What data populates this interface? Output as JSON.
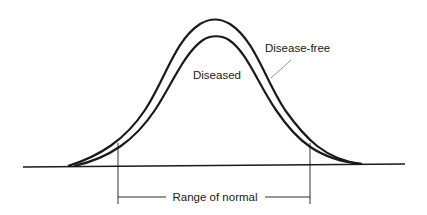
{
  "figure": {
    "type": "diagram",
    "curves": [
      {
        "name": "Disease-free",
        "label": "Disease-free"
      },
      {
        "name": "Diseased",
        "label": "Diseased"
      }
    ],
    "range_label": "Range of normal",
    "colors": {
      "line": "#1a1a1a",
      "leader": "#888888",
      "background": "#ffffff"
    }
  }
}
